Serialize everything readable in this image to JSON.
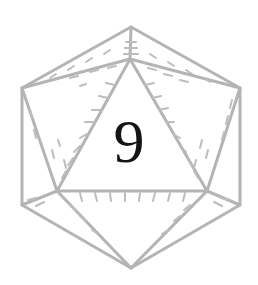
{
  "die": {
    "type": "d20",
    "icon": "icosahedron-die-icon",
    "face_value": "9",
    "line_color": "#b4b4b4",
    "number_color": "#141414"
  }
}
